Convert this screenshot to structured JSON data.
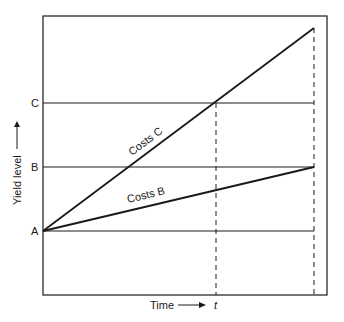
{
  "diagram": {
    "y_axis_label": "Yield level",
    "x_axis_label": "Time",
    "x_marker": "t",
    "levels": [
      {
        "label": "A",
        "y": 231
      },
      {
        "label": "B",
        "y": 167
      },
      {
        "label": "C",
        "y": 103
      }
    ],
    "lines": [
      {
        "label": "Costs C",
        "from": [
          43,
          231
        ],
        "to": [
          314,
          28
        ]
      },
      {
        "label": "Costs B",
        "from": [
          43,
          231
        ],
        "to": [
          314,
          167
        ]
      }
    ],
    "colors": {
      "line": "#1a1a1a",
      "background": "#ffffff"
    }
  }
}
